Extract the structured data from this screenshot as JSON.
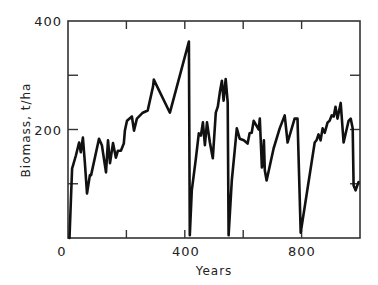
{
  "chart_data": {
    "type": "line",
    "title": "",
    "xlabel": "Years",
    "ylabel": "Biomass, t/ha",
    "xlim": [
      0,
      1000
    ],
    "ylim": [
      0,
      400
    ],
    "x_ticks": [
      0,
      400,
      800
    ],
    "x_tick_labels": [
      "0",
      "400",
      "800"
    ],
    "x_minor_ticks": [
      200,
      400,
      600,
      800
    ],
    "y_ticks": [
      200,
      400
    ],
    "y_tick_labels": [
      "200",
      "400"
    ],
    "y_minor_ticks": [
      100,
      200,
      300
    ],
    "grid": false,
    "legend": null,
    "series": [
      {
        "name": "Biomass",
        "color": "#111111",
        "x": [
          5,
          10,
          14,
          27,
          38,
          44,
          51,
          58,
          65,
          75,
          79,
          106,
          116,
          130,
          137,
          144,
          154,
          164,
          171,
          181,
          191,
          195,
          202,
          219,
          226,
          236,
          256,
          273,
          291,
          294,
          349,
          414,
          417,
          424,
          438,
          448,
          455,
          462,
          469,
          476,
          486,
          496,
          506,
          513,
          520,
          527,
          533,
          540,
          547,
          550,
          561,
          571,
          578,
          588,
          602,
          615,
          622,
          629,
          636,
          653,
          657,
          664,
          667,
          671,
          674,
          680,
          704,
          725,
          742,
          752,
          776,
          786,
          797,
          845,
          851,
          858,
          865,
          872,
          879,
          889,
          896,
          903,
          910,
          916,
          923,
          934,
          944,
          961,
          968,
          975,
          978,
          985,
          995
        ],
        "y": [
          0,
          70,
          128,
          152,
          176,
          158,
          185,
          138,
          82,
          116,
          116,
          183,
          171,
          121,
          180,
          138,
          175,
          148,
          161,
          161,
          174,
          198,
          216,
          224,
          198,
          220,
          231,
          235,
          279,
          292,
          231,
          362,
          5,
          88,
          147,
          193,
          189,
          213,
          171,
          213,
          176,
          147,
          231,
          242,
          268,
          290,
          253,
          293,
          250,
          5,
          106,
          161,
          202,
          183,
          180,
          174,
          193,
          194,
          216,
          200,
          220,
          130,
          143,
          180,
          125,
          106,
          165,
          202,
          226,
          176,
          220,
          220,
          10,
          176,
          180,
          191,
          180,
          202,
          194,
          213,
          216,
          226,
          224,
          242,
          220,
          249,
          176,
          216,
          220,
          202,
          97,
          88,
          103
        ]
      }
    ]
  },
  "axes": {
    "x_title": "Years",
    "y_title": "Biomass, t/ha",
    "x_tick_text": [
      "0",
      "400",
      "800"
    ],
    "y_tick_text": [
      "200",
      "400"
    ]
  }
}
